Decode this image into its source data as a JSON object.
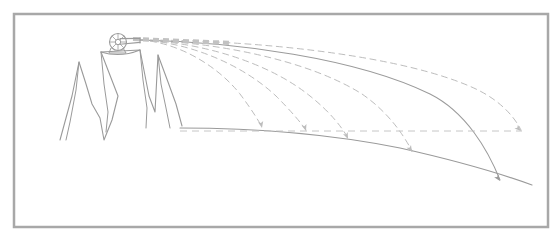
{
  "figure": {
    "canvas": {
      "width": 560,
      "height": 242
    },
    "style": {
      "background_color": "#ffffff",
      "frame_color": "#a8a8a8",
      "sketch_line_color": "#9a9a9a",
      "trajectory_dashed_color": "#bdbdbd",
      "trajectory_solid_color": "#9b9b9b",
      "ground_color": "#9a9a9a",
      "cannon_color": "#9c9c9c",
      "launch_beam_color": "#c2c2c2"
    },
    "frame": {
      "x": 14,
      "y": 14,
      "width": 534,
      "height": 213,
      "stroke_width": 2.5
    },
    "cannon": {
      "label": "cannon",
      "muzzle_point": {
        "x": 140,
        "y": 40
      },
      "wheel_center": {
        "x": 118,
        "y": 42
      },
      "wheel_radius": 8.5,
      "barrel_length": 22,
      "spoke_count": 8
    },
    "launch_beam": {
      "label": "launch-beam",
      "from": {
        "x": 133,
        "y": 39
      },
      "to": {
        "x": 232,
        "y": 43
      },
      "stroke_width": 4.2,
      "dash": "6 4"
    },
    "mountain": {
      "label": "mountain-range",
      "plateau_left": {
        "x": 101,
        "y": 52
      },
      "plateau_right": {
        "x": 140,
        "y": 50
      },
      "peaks": [
        {
          "name": "left-small-peak",
          "x": 80,
          "y": 62
        },
        {
          "name": "central-plateau",
          "x": 120,
          "y": 50
        },
        {
          "name": "right-peak",
          "x": 158,
          "y": 55
        }
      ],
      "outline": "M 60,140 L 72,96 L 79,62 L 86,84 L 92,104 L 100,118 L 104,140 L 112,120 L 118,96 L 101,52 L 140,50 L 149,96 L 155,112 L 158,55 L 168,82 L 176,104 L 182,126",
      "ridge_lines": [
        "M 79,62 L 76,90 L 70,122 L 66,140",
        "M 101,52 L 104,84 L 108,112 L 106,132",
        "M 140,50 L 143,80 L 147,108 L 146,128",
        "M 158,55 L 161,84 L 166,108 L 170,128"
      ],
      "plateau_rim": "M 101,52 Q 120,58 140,50"
    },
    "ground": {
      "label": "curved-earth-surface",
      "path": "M 180,128 Q 300,128 400,148 Q 480,166 532,185",
      "start": {
        "x": 180,
        "y": 128
      },
      "end": {
        "x": 532,
        "y": 185
      },
      "stroke_width": 1.1
    },
    "horizon_reference": {
      "label": "horizontal-reference-line",
      "from": {
        "x": 180,
        "y": 131
      },
      "to": {
        "x": 522,
        "y": 131
      }
    }
  },
  "chart_data": {
    "type": "line",
    "subtitle": "Projectile paths of increasing launch speed from a mountaintop cannon",
    "xlabel": "",
    "ylabel": "",
    "grid": false,
    "legend_position": "none",
    "launch_origin": {
      "x": 140,
      "y": 40
    },
    "trajectory_count": 6,
    "trajectories": [
      {
        "name": "trajectory-1",
        "index": 1,
        "style": "dashed",
        "relative_speed": 1,
        "impact_point": {
          "x": 262,
          "y": 128
        },
        "range_px": 122,
        "path": "M 140,40 C 176,42 216,64 240,94 C 252,110 258,120 262,127",
        "arrow_angle_deg": 78
      },
      {
        "name": "trajectory-2",
        "index": 2,
        "style": "dashed",
        "relative_speed": 2,
        "impact_point": {
          "x": 306,
          "y": 131
        },
        "range_px": 166,
        "path": "M 140,40 C 188,42 242,64 276,96 C 292,112 301,123 306,130",
        "arrow_angle_deg": 72
      },
      {
        "name": "trajectory-3",
        "index": 3,
        "style": "dashed",
        "relative_speed": 3,
        "impact_point": {
          "x": 348,
          "y": 139
        },
        "range_px": 208,
        "path": "M 140,40 C 200,42 268,62 310,96 C 330,112 341,126 348,138",
        "arrow_angle_deg": 66
      },
      {
        "name": "trajectory-4",
        "index": 4,
        "style": "dashed",
        "relative_speed": 4,
        "impact_point": {
          "x": 412,
          "y": 152
        },
        "range_px": 272,
        "path": "M 140,40 C 216,42 308,60 362,94 C 388,112 403,134 412,151",
        "arrow_angle_deg": 60
      },
      {
        "name": "trajectory-5",
        "index": 5,
        "style": "solid",
        "relative_speed": 5,
        "impact_point": {
          "x": 500,
          "y": 181
        },
        "range_px": 360,
        "path": "M 140,40 C 236,42 356,58 430,94 C 466,112 488,150 500,180",
        "arrow_angle_deg": 55
      },
      {
        "name": "trajectory-6-orbital",
        "index": 6,
        "style": "dashed",
        "relative_speed": 6,
        "note": "orbital path - never reaches the ground",
        "impact_point": {
          "x": 521,
          "y": 131
        },
        "range_px": 381,
        "path": "M 140,40 C 260,40 408,56 478,90 C 502,102 515,118 521,130",
        "arrow_angle_deg": 42
      }
    ]
  }
}
